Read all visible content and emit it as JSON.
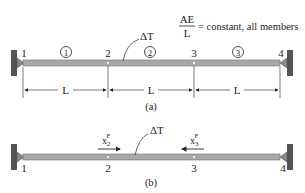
{
  "legend": {
    "fraction_num": "AE",
    "fraction_den": "L",
    "text": "= constant, all members"
  },
  "figure_a": {
    "caption": "(a)",
    "nodes": [
      "1",
      "2",
      "3",
      "4"
    ],
    "members": [
      "1",
      "2",
      "3"
    ],
    "load_label": "ΔT",
    "spans": [
      "L",
      "L",
      "L"
    ]
  },
  "figure_b": {
    "caption": "(b)",
    "nodes": [
      "1",
      "2",
      "3",
      "4"
    ],
    "load_label": "ΔT",
    "forces": [
      {
        "base": "x",
        "sub": "2",
        "sup": "F",
        "direction": "right"
      },
      {
        "base": "x",
        "sub": "3",
        "sup": "F",
        "direction": "left"
      }
    ]
  },
  "colors": {
    "bar_fill": "#a8a8a8",
    "bar_edge": "#6e6e6e",
    "wall": "#555555",
    "line": "#222222"
  }
}
